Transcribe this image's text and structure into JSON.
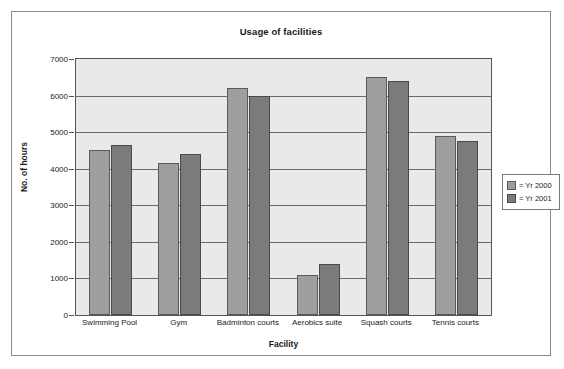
{
  "chart_data": {
    "type": "bar",
    "title": "Usage of facilities",
    "xlabel": "Facility",
    "ylabel": "No. of hours",
    "categories": [
      "Swimming Pool",
      "Gym",
      "Badminton courts",
      "Aerobics suite",
      "Squash courts",
      "Tennis courts"
    ],
    "series": [
      {
        "name": "Yr 2000",
        "legend_label": "= Yr 2000",
        "color": "#9e9e9e",
        "values": [
          4500,
          4150,
          6200,
          1100,
          6500,
          4900
        ]
      },
      {
        "name": "Yr 2001",
        "legend_label": "= Yr 2001",
        "color": "#7b7b7b",
        "values": [
          4650,
          4400,
          6000,
          1400,
          6400,
          4750
        ]
      }
    ],
    "ylim": [
      0,
      7000
    ],
    "ytick_labels": [
      "7000",
      "6000",
      "5000",
      "4000",
      "3000",
      "2000",
      "1000",
      "0"
    ],
    "ytick_values": [
      7000,
      6000,
      5000,
      4000,
      3000,
      2000,
      1000,
      0
    ],
    "grid": true,
    "legend_position": "right",
    "plot_background": "#e9e9e9",
    "frame_border": "#8a8a8a"
  }
}
